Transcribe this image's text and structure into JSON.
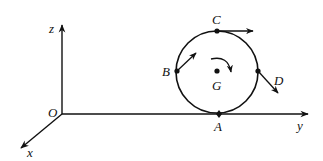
{
  "diagram": {
    "type": "3d-axes-with-rolling-disc",
    "axes": {
      "origin_label": "O",
      "x_label": "x",
      "y_label": "y",
      "z_label": "z"
    },
    "disc": {
      "center_label": "G",
      "rotation": "clockwise",
      "points": [
        {
          "label": "A",
          "position": "bottom",
          "velocity_arrow": false
        },
        {
          "label": "B",
          "position": "left",
          "velocity_arrow": true,
          "arrow_direction": "up-right"
        },
        {
          "label": "C",
          "position": "top",
          "velocity_arrow": true,
          "arrow_direction": "right"
        },
        {
          "label": "D",
          "position": "right",
          "velocity_arrow": true,
          "arrow_direction": "down-right"
        }
      ]
    },
    "colors": {
      "stroke": "#111111",
      "background": "#ffffff"
    }
  }
}
